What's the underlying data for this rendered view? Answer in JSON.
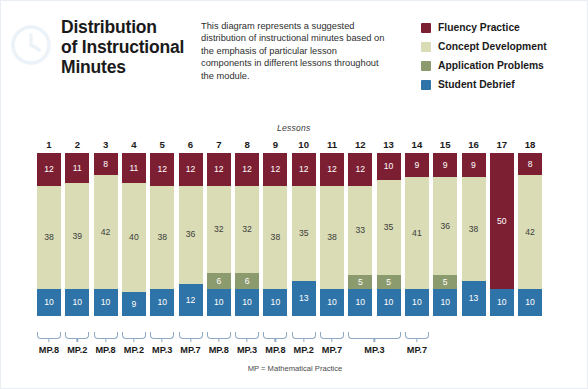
{
  "header": {
    "icon": "clock-icon",
    "title_lines": [
      "Distribution",
      "of Instructional",
      "Minutes"
    ],
    "description": "This diagram represents a suggested distribution of instructional minutes based on the emphasis of particular lesson components in different lessons throughout the module."
  },
  "legend": {
    "items": [
      {
        "label": "Fluency Practice",
        "color": "#7d1f33",
        "key": "fluency"
      },
      {
        "label": "Concept Development",
        "color": "#d9dcb4",
        "key": "concept"
      },
      {
        "label": "Application Problems",
        "color": "#8c9b6e",
        "key": "application"
      },
      {
        "label": "Student Debrief",
        "color": "#2f74a8",
        "key": "debrief"
      }
    ]
  },
  "chart_axis": {
    "lessons_label": "Lessons",
    "footnote": "MP = Mathematical Practice"
  },
  "mp_groups": [
    {
      "label": "MP.8",
      "start": 1,
      "span": 1
    },
    {
      "label": "MP.2",
      "start": 2,
      "span": 1
    },
    {
      "label": "MP.8",
      "start": 3,
      "span": 1
    },
    {
      "label": "MP.2",
      "start": 4,
      "span": 1
    },
    {
      "label": "MP.3",
      "start": 5,
      "span": 1
    },
    {
      "label": "MP.7",
      "start": 6,
      "span": 1
    },
    {
      "label": "MP.8",
      "start": 7,
      "span": 1
    },
    {
      "label": "MP.3",
      "start": 8,
      "span": 1
    },
    {
      "label": "MP.8",
      "start": 9,
      "span": 1
    },
    {
      "label": "MP.2",
      "start": 10,
      "span": 1
    },
    {
      "label": "MP.7",
      "start": 11,
      "span": 1
    },
    {
      "label": "MP.3",
      "start": 12,
      "span": 2
    },
    {
      "label": "MP.7",
      "start": 14,
      "span": 1
    }
  ],
  "chart_data": {
    "type": "bar",
    "title": "Distribution of Instructional Minutes",
    "xlabel": "Lessons",
    "ylabel": "Instructional Minutes",
    "ylim": [
      0,
      60
    ],
    "stacked": true,
    "grid": false,
    "legend_position": "top-right",
    "categories": [
      "1",
      "2",
      "3",
      "4",
      "5",
      "6",
      "7",
      "8",
      "9",
      "10",
      "11",
      "12",
      "13",
      "14",
      "15",
      "16",
      "17",
      "18"
    ],
    "series": [
      {
        "name": "Fluency Practice",
        "color": "#7d1f33",
        "values": [
          12,
          11,
          8,
          11,
          12,
          12,
          12,
          12,
          12,
          12,
          12,
          12,
          10,
          9,
          9,
          9,
          50,
          8
        ]
      },
      {
        "name": "Concept Development",
        "color": "#d9dcb4",
        "values": [
          38,
          39,
          42,
          40,
          38,
          36,
          32,
          32,
          38,
          35,
          38,
          33,
          35,
          41,
          36,
          38,
          0,
          42
        ]
      },
      {
        "name": "Application Problems",
        "color": "#8c9b6e",
        "values": [
          0,
          0,
          0,
          0,
          0,
          0,
          6,
          6,
          0,
          0,
          0,
          5,
          5,
          0,
          5,
          0,
          0,
          0
        ]
      },
      {
        "name": "Student Debrief",
        "color": "#2f74a8",
        "values": [
          10,
          10,
          10,
          9,
          10,
          12,
          10,
          10,
          10,
          13,
          10,
          10,
          10,
          10,
          10,
          13,
          10,
          10
        ]
      }
    ],
    "totals": [
      60,
      60,
      60,
      60,
      60,
      60,
      60,
      60,
      60,
      60,
      60,
      60,
      60,
      60,
      60,
      60,
      60,
      60
    ],
    "segment_order": [
      "fluency",
      "concept",
      "application",
      "debrief"
    ],
    "annotations": [
      "MP = Mathematical Practice"
    ]
  }
}
